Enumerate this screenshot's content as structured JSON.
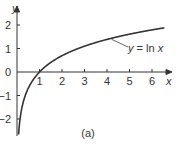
{
  "chart_data": {
    "type": "line",
    "title": "",
    "caption": "(a)",
    "xlabel": "x",
    "ylabel": "y",
    "xlim": [
      0,
      6.7
    ],
    "ylim": [
      -2.7,
      2.7
    ],
    "x_ticks": [
      1,
      2,
      3,
      4,
      5,
      6
    ],
    "x_tick_labels": [
      "1",
      "2",
      "3",
      "4",
      "5",
      "6"
    ],
    "y_ticks": [
      -2,
      -1,
      0,
      1,
      2
    ],
    "y_tick_labels": [
      "-2",
      "-1",
      "0",
      "1",
      "2"
    ],
    "grid": false,
    "series": [
      {
        "name": "y = ln x",
        "function": "ln(x)",
        "x": [
          0.07,
          0.1,
          0.2,
          0.3,
          0.5,
          0.75,
          1,
          1.5,
          2,
          3,
          4,
          5,
          6,
          6.5
        ],
        "values": [
          -2.66,
          -2.3,
          -1.61,
          -1.2,
          -0.69,
          -0.29,
          0,
          0.41,
          0.69,
          1.1,
          1.39,
          1.61,
          1.79,
          1.87
        ]
      }
    ],
    "annotations": [
      {
        "text": "y = ln x",
        "points_to_x": 4.2
      }
    ]
  },
  "labels": {
    "y_axis": "y",
    "x_axis": "x",
    "curve_label_y": "y",
    "curve_label_eq": " = ln ",
    "curve_label_x": "x",
    "caption": "(a)",
    "origin": "0"
  }
}
